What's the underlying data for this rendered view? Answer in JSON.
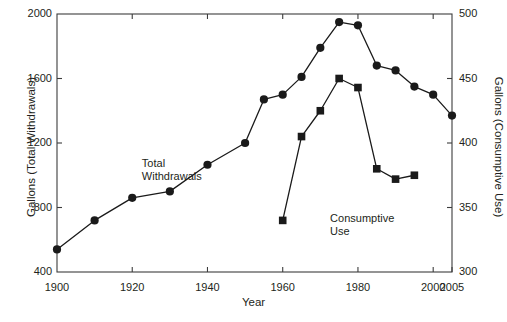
{
  "chart_data": {
    "type": "line",
    "title": "",
    "xlabel": "Year",
    "ylabel": "Gallons (Total Withdrawals)",
    "ylabel_right": "Gallons (Consumptive Use)",
    "grid": false,
    "legend": "inline-annotations",
    "xlim": [
      1900,
      2005
    ],
    "xticks": [
      1900,
      1920,
      1940,
      1960,
      1980,
      2000,
      2005
    ],
    "xticklabels": [
      "1900",
      "1920",
      "1940",
      "1960",
      "1980",
      "2000",
      "2005"
    ],
    "ylim": [
      400,
      2000
    ],
    "yticks": [
      400,
      800,
      1200,
      1600,
      2000
    ],
    "yticklabels": [
      "400",
      "800",
      "1200",
      "1600",
      "2000"
    ],
    "ylim_right": [
      300,
      500
    ],
    "yticks_right": [
      300,
      350,
      400,
      450,
      500
    ],
    "yticklabels_right": [
      "300",
      "350",
      "400",
      "450",
      "500"
    ],
    "series": [
      {
        "name": "Total Withdrawals",
        "axis": "left",
        "marker": "circle",
        "color": "#1a1a1a",
        "x": [
          1900,
          1910,
          1920,
          1930,
          1940,
          1950,
          1955,
          1960,
          1965,
          1970,
          1975,
          1980,
          1985,
          1990,
          1995,
          2000,
          2005
        ],
        "values": [
          540,
          720,
          860,
          900,
          1065,
          1200,
          1470,
          1500,
          1610,
          1790,
          1950,
          1930,
          1680,
          1650,
          1550,
          1500,
          1370
        ]
      },
      {
        "name": "Consumptive Use",
        "axis": "right",
        "marker": "square",
        "color": "#1a1a1a",
        "x": [
          1960,
          1965,
          1970,
          1975,
          1980,
          1985,
          1990,
          1995
        ],
        "values": [
          340,
          405,
          425,
          450,
          443,
          380,
          372,
          375
        ]
      }
    ],
    "annotations": [
      {
        "text": "Total\nWithdrawals",
        "line1": "Total",
        "line2": "Withdrawals",
        "x": 1930,
        "y": 1030
      },
      {
        "text": "Consumptive\nUse",
        "line1": "Consumptive",
        "line2": "Use",
        "x": 1971,
        "y": 690
      }
    ]
  },
  "axes": {
    "left_title": "Gallons (Total Withdrawals)",
    "right_title": "Gallons (Consumptive Use)",
    "x_title": "Year"
  },
  "labels": {
    "total_withdrawals_line1": "Total",
    "total_withdrawals_line2": "Withdrawals",
    "consumptive_use_line1": "Consumptive",
    "consumptive_use_line2": "Use"
  }
}
